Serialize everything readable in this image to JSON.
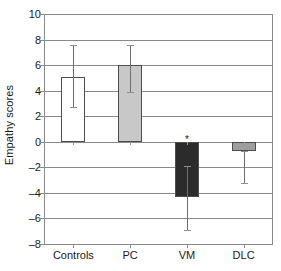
{
  "chart_data": {
    "type": "bar",
    "title": "",
    "xlabel": "",
    "ylabel": "Empathy scores",
    "categories": [
      "Controls",
      "PC",
      "VM",
      "DLC"
    ],
    "values": [
      5.1,
      6.0,
      -4.3,
      -0.7
    ],
    "errors_low": [
      2.7,
      3.9,
      -6.9,
      -3.2
    ],
    "errors_high": [
      7.6,
      7.6,
      -1.9,
      -0.7
    ],
    "bar_colors": [
      "#ffffff",
      "#c8c8c8",
      "#2b2b2b",
      "#9e9e9e"
    ],
    "bar_edge_color": "#4d4d4d",
    "ylim": [
      -8,
      10
    ],
    "yticks": [
      10,
      8,
      6,
      4,
      2,
      0,
      -2,
      -4,
      -6,
      -8
    ],
    "ytick_labels": [
      "10",
      "8",
      "6",
      "4",
      "2",
      "0",
      "–2",
      "–4",
      "–6",
      "–8"
    ],
    "grid": true,
    "grid_color": "#8a8a8a",
    "legend": null,
    "annotations": [
      {
        "text": "*",
        "category": "VM",
        "value": 0.55
      }
    ]
  }
}
